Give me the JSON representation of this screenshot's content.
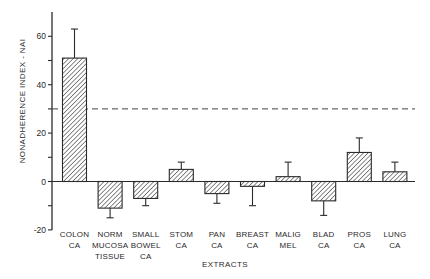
{
  "chart_data": {
    "type": "bar",
    "title": "",
    "xlabel": "EXTRACTS",
    "ylabel": "NONADHERENCE INDEX - NAI",
    "ylim": [
      -20,
      70
    ],
    "yticks": [
      -20,
      0,
      20,
      40,
      60
    ],
    "minor_yticks": [
      -10,
      10,
      30,
      50
    ],
    "grid": false,
    "legend": null,
    "categories": [
      [
        "COLON",
        "CA"
      ],
      [
        "NORM",
        "MUCOSA",
        "TISSUE"
      ],
      [
        "SMALL",
        "BOWEL",
        "CA"
      ],
      [
        "STOM",
        "CA"
      ],
      [
        "PAN",
        "CA"
      ],
      [
        "BREAST",
        "CA"
      ],
      [
        "MALIG",
        "MEL"
      ],
      [
        "BLAD",
        "CA"
      ],
      [
        "PROS",
        "CA"
      ],
      [
        "LUNG",
        "CA"
      ]
    ],
    "values": [
      51,
      -11,
      -7,
      5,
      -5,
      -2,
      2,
      -8,
      12,
      4
    ],
    "error_bars": [
      12,
      4,
      3,
      3,
      4,
      8,
      6,
      6,
      6,
      4
    ],
    "reference_line": {
      "y": 30,
      "style": "dashed"
    },
    "bar_fill": "diagonal-hatch",
    "colors": {
      "ink": "#2a2a2a",
      "background": "#ffffff"
    }
  }
}
